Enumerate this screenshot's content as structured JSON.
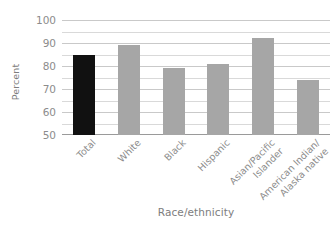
{
  "chart_data": {
    "type": "bar",
    "title": "",
    "xlabel": "Race/ethnicity",
    "ylabel": "Percent",
    "categories": [
      "Total",
      "White",
      "Black",
      "Hispanic",
      "Asian/Pacific\nIslander",
      "American Indian/\nAlaska native"
    ],
    "values": [
      85,
      89,
      79,
      81,
      92,
      74
    ],
    "ylim": [
      50,
      100
    ],
    "ytick_labels": [
      "100",
      "90",
      "80",
      "70",
      "60",
      "50"
    ],
    "ytick_values": [
      100,
      90,
      80,
      70,
      60,
      50
    ],
    "minor_gridline_values": [
      95,
      85,
      75,
      65,
      55
    ],
    "grid": true,
    "legend": "none",
    "bar_colors": [
      "#111111",
      "#a6a6a6",
      "#a6a6a6",
      "#a6a6a6",
      "#a6a6a6",
      "#a6a6a6"
    ]
  },
  "style": {
    "highlight_color": "#111111",
    "bar_color": "#a6a6a6",
    "gridline_color": "#c9c9c9",
    "text_color": "#8c8c8c",
    "background": "#ffffff"
  }
}
